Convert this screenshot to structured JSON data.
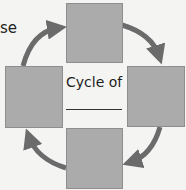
{
  "diagram": {
    "type": "cycle",
    "direction": "clockwise",
    "partial_label_left": "se",
    "center": {
      "title": "Cycle of",
      "blank": "________"
    },
    "boxes": [
      {
        "id": "top",
        "text": ""
      },
      {
        "id": "right",
        "text": ""
      },
      {
        "id": "bottom",
        "text": ""
      },
      {
        "id": "left",
        "text": ""
      }
    ],
    "arrows": [
      {
        "from": "left",
        "to": "top"
      },
      {
        "from": "top",
        "to": "right"
      },
      {
        "from": "right",
        "to": "bottom"
      },
      {
        "from": "bottom",
        "to": "left"
      }
    ],
    "colors": {
      "background": "#f4f4f2",
      "box_fill": "#ababab",
      "box_border": "#8e8e8e",
      "arrow": "#6b6b6b",
      "text": "#1d1d1d"
    }
  }
}
